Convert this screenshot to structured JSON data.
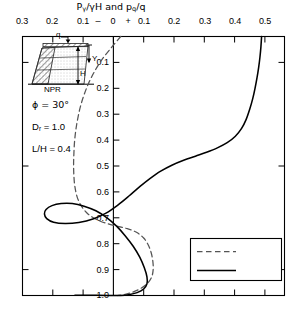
{
  "chart_data": {
    "type": "line",
    "title": "Pγ/γH and pq/q",
    "title_parts": {
      "p1": "P",
      "sub1": "γ",
      "mid": "/γH and p",
      "sub2": "q",
      "end": "/q"
    },
    "xlabel": "",
    "ylabel": "",
    "orientation": "vertical-depth",
    "xlim": [
      -0.3,
      0.5
    ],
    "ylim": [
      0.0,
      1.0
    ],
    "y_inverted": true,
    "grid": false,
    "x_axis_position": "top",
    "x_ticks": [
      -0.3,
      -0.2,
      -0.1,
      0.0,
      0.1,
      0.2,
      0.3,
      0.4,
      0.5
    ],
    "x_tick_labels": [
      "0.3",
      "0.2",
      "0.1",
      "0",
      "0.1",
      "0.2",
      "0.3",
      "0.4",
      "0.5"
    ],
    "x_sign_markers": [
      "–",
      "+"
    ],
    "y_ticks": [
      0.1,
      0.2,
      0.3,
      0.4,
      0.5,
      0.6,
      0.7,
      0.8,
      0.9,
      1.0
    ],
    "y_tick_labels": [
      "0.1",
      "0.2",
      "0.3",
      "0.4",
      "0.5",
      "0.6",
      "0.7",
      "0.8",
      "0.9",
      "1.0"
    ],
    "zero_line": 0.0,
    "series": [
      {
        "name": "Pγ/γH",
        "style": "dashed",
        "color": "#555555",
        "points": [
          [
            0.0,
            0.0
          ],
          [
            -0.03,
            0.045
          ],
          [
            -0.058,
            0.09
          ],
          [
            -0.08,
            0.135
          ],
          [
            -0.098,
            0.18
          ],
          [
            -0.112,
            0.225
          ],
          [
            -0.123,
            0.27
          ],
          [
            -0.131,
            0.315
          ],
          [
            -0.137,
            0.36
          ],
          [
            -0.141,
            0.405
          ],
          [
            -0.143,
            0.45
          ],
          [
            -0.144,
            0.495
          ],
          [
            -0.143,
            0.54
          ],
          [
            -0.14,
            0.58
          ],
          [
            -0.133,
            0.62
          ],
          [
            -0.12,
            0.655
          ],
          [
            -0.1,
            0.685
          ],
          [
            -0.072,
            0.708
          ],
          [
            -0.04,
            0.723
          ],
          [
            -0.01,
            0.733
          ],
          [
            0.02,
            0.742
          ],
          [
            0.048,
            0.756
          ],
          [
            0.07,
            0.778
          ],
          [
            0.084,
            0.805
          ],
          [
            0.093,
            0.835
          ],
          [
            0.098,
            0.868
          ],
          [
            0.099,
            0.9
          ],
          [
            0.094,
            0.93
          ],
          [
            0.08,
            0.955
          ],
          [
            0.058,
            0.975
          ],
          [
            0.032,
            0.989
          ],
          [
            0.008,
            0.997
          ],
          [
            -0.01,
            1.0
          ]
        ]
      },
      {
        "name": "Pq/q",
        "style": "solid",
        "color": "#000000",
        "points": [
          [
            0.43,
            0.0
          ],
          [
            0.428,
            0.04
          ],
          [
            0.425,
            0.08
          ],
          [
            0.421,
            0.12
          ],
          [
            0.416,
            0.16
          ],
          [
            0.41,
            0.2
          ],
          [
            0.403,
            0.24
          ],
          [
            0.394,
            0.28
          ],
          [
            0.383,
            0.32
          ],
          [
            0.369,
            0.355
          ],
          [
            0.35,
            0.385
          ],
          [
            0.325,
            0.41
          ],
          [
            0.295,
            0.43
          ],
          [
            0.262,
            0.447
          ],
          [
            0.228,
            0.462
          ],
          [
            0.192,
            0.478
          ],
          [
            0.156,
            0.497
          ],
          [
            0.122,
            0.52
          ],
          [
            0.09,
            0.548
          ],
          [
            0.058,
            0.58
          ],
          [
            0.026,
            0.615
          ],
          [
            -0.008,
            0.65
          ],
          [
            -0.045,
            0.682
          ],
          [
            -0.085,
            0.705
          ],
          [
            -0.128,
            0.718
          ],
          [
            -0.17,
            0.722
          ],
          [
            -0.205,
            0.717
          ],
          [
            -0.226,
            0.703
          ],
          [
            -0.233,
            0.685
          ],
          [
            -0.228,
            0.668
          ],
          [
            -0.21,
            0.653
          ],
          [
            -0.182,
            0.645
          ],
          [
            -0.148,
            0.645
          ],
          [
            -0.112,
            0.655
          ],
          [
            -0.076,
            0.673
          ],
          [
            -0.042,
            0.7
          ],
          [
            -0.012,
            0.733
          ],
          [
            0.014,
            0.77
          ],
          [
            0.038,
            0.81
          ],
          [
            0.058,
            0.852
          ],
          [
            0.072,
            0.893
          ],
          [
            0.08,
            0.928
          ],
          [
            0.08,
            0.955
          ],
          [
            0.07,
            0.975
          ],
          [
            0.05,
            0.989
          ],
          [
            0.024,
            0.997
          ],
          [
            0.0,
            1.0
          ],
          [
            -0.04,
            1.0
          ],
          [
            -0.09,
            0.999
          ],
          [
            -0.14,
            0.999
          ]
        ]
      }
    ]
  },
  "legend": {
    "position": "bottom-right",
    "entries": [
      {
        "label_parts": {
          "p": "P",
          "sub": "γ",
          "rest": "/γH"
        },
        "style": "dashed"
      },
      {
        "label_parts": {
          "p": "P",
          "sub": "q",
          "rest": "/q"
        },
        "style": "solid"
      }
    ]
  },
  "annotations": {
    "params": [
      {
        "parts": {
          "p": "ϕ = 30°",
          "sub": "",
          "rest": ""
        }
      },
      {
        "parts": {
          "p": "D",
          "sub": "r",
          "rest": " = 1.0"
        }
      },
      {
        "parts": {
          "p": "L/H = 0.4",
          "sub": "",
          "rest": ""
        }
      }
    ]
  },
  "inset": {
    "surcharge_label": "q",
    "depth_label": "Y",
    "height_label": "H",
    "base_label": "NPR"
  }
}
